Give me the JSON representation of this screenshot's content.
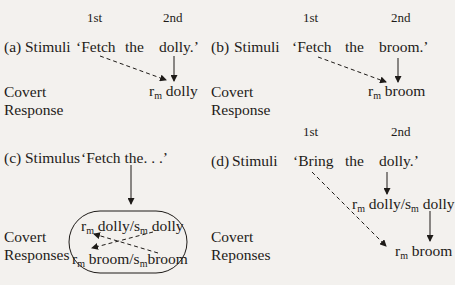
{
  "panels": {
    "a": {
      "label": "(a)",
      "stimulus_label": "Stimuli",
      "order": [
        "1st",
        "2nd"
      ],
      "words": [
        "‘Fetch",
        "the",
        "dolly.’"
      ],
      "response_label": [
        "Covert",
        "Response"
      ],
      "response": {
        "r": "r",
        "sub": "m",
        "word": "dolly"
      }
    },
    "b": {
      "label": "(b)",
      "stimulus_label": "Stimuli",
      "order": [
        "1st",
        "2nd"
      ],
      "words": [
        "‘Fetch",
        "the",
        "broom.’"
      ],
      "response_label": [
        "Covert",
        "Response"
      ],
      "response": {
        "r": "r",
        "sub": "m",
        "word": "broom"
      }
    },
    "c": {
      "label": "(c)",
      "stimulus_label": "Stimulus",
      "words": "‘Fetch the. . .’",
      "response_label": [
        "Covert",
        "Responses"
      ],
      "responses": [
        {
          "r": "r",
          "sub": "m",
          "word": "dolly/",
          "s": "s",
          "ssub": "m",
          "sword": "dolly"
        },
        {
          "r": "r",
          "sub": "m",
          "word": "broom/",
          "s": "s",
          "ssub": "m",
          "sword": "broom"
        }
      ]
    },
    "d": {
      "label": "(d)",
      "stimulus_label": "Stimuli",
      "order": [
        "1st",
        "2nd"
      ],
      "words": [
        "‘Bring",
        "the",
        "dolly.’"
      ],
      "response_label": [
        "Covert",
        "Reponses"
      ],
      "responses": [
        {
          "r": "r",
          "sub": "m",
          "word": "dolly/",
          "s": "s",
          "ssub": "m",
          "sword": "dolly"
        },
        {
          "r": "r",
          "sub": "m",
          "word": "broom"
        }
      ]
    }
  }
}
